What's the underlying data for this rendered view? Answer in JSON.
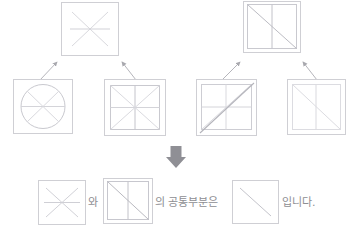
{
  "page": {
    "kind": "set-intersection-figure",
    "background_color": "#ffffff"
  },
  "palette": {
    "box_border": "#cfcfd4",
    "inner_border": "#d5d5da",
    "line_light": "#dcdce1",
    "line_mid": "#c9c9cf",
    "line_dark": "#a9a9b0",
    "arrow_color": "#b5b5bb",
    "down_arrow_color": "#8f8f95",
    "text_color": "#8e8e92"
  },
  "top_row": {
    "left_box": {
      "label": "six-spoke-asterisk-box",
      "contents": [
        "diagonal-tl-br",
        "diagonal-tr-bl",
        "horizontal-center"
      ]
    },
    "right_box": {
      "label": "diagonal-and-vertical-box",
      "contents": [
        "inner-square",
        "vertical-center",
        "diagonal-tl-br"
      ]
    }
  },
  "bottom_row": {
    "boxes": [
      {
        "label": "circle-with-six-spokes-box",
        "contents": [
          "circle",
          "horizontal-center",
          "diagonal-tl-br",
          "diagonal-tr-bl"
        ]
      },
      {
        "label": "eight-segment-square-box",
        "contents": [
          "inner-square",
          "horizontal-center",
          "vertical-center",
          "diagonal-tl-br",
          "diagonal-tr-bl"
        ]
      },
      {
        "label": "square-with-crossed-diagonals-box",
        "contents": [
          "inner-square",
          "horizontal-center",
          "vertical-center",
          "diagonal-tl-br-emphasized",
          "diagonal-tr-bl"
        ]
      },
      {
        "label": "square-with-vertical-and-diagonal-box",
        "contents": [
          "inner-square",
          "vertical-center",
          "diagonal-tl-br"
        ]
      }
    ]
  },
  "arrows": {
    "up_arrows": [
      {
        "name": "arrow-from-circle-box-to-asterisk-box"
      },
      {
        "name": "arrow-from-eight-segment-box-to-asterisk-box"
      },
      {
        "name": "arrow-from-crossed-diagonals-box-to-diagonal-vertical-box"
      },
      {
        "name": "arrow-from-vertical-diagonal-box-to-diagonal-vertical-box"
      }
    ],
    "down_arrow": {
      "name": "down-arrow",
      "glyph": "↓"
    }
  },
  "conclusion": {
    "first_shape": {
      "label": "asterisk-result-box",
      "contents": [
        "diagonal-tl-br",
        "diagonal-tr-bl",
        "horizontal-center"
      ]
    },
    "connector_1": "와",
    "second_shape": {
      "label": "diagonal-vertical-result-box",
      "contents": [
        "inner-square",
        "vertical-center",
        "diagonal-tl-br"
      ]
    },
    "connector_2": "의 공통부분은",
    "result_shape": {
      "label": "intersection-result-box",
      "contents": [
        "diagonal-tl-br"
      ]
    },
    "ending": "입니다."
  }
}
